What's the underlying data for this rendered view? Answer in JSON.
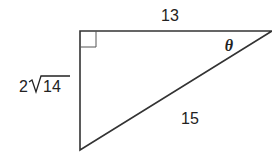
{
  "diagram": {
    "type": "right-triangle",
    "labels": {
      "top_side": "13",
      "left_side_coeff": "2",
      "left_side_radicand": "14",
      "hypotenuse": "15",
      "angle": "θ"
    },
    "colors": {
      "stroke": "#333333",
      "text": "#222222"
    }
  }
}
